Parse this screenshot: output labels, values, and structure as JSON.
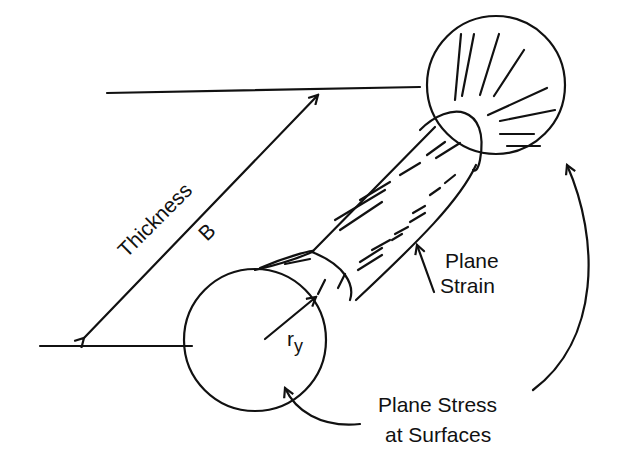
{
  "diagram": {
    "labels": {
      "thickness": "Thickness",
      "thickness_symbol": "B",
      "radius_main": "r",
      "radius_sub": "y",
      "plane_strain_line1": "Plane",
      "plane_strain_line2": "Strain",
      "plane_stress_line1": "Plane Stress",
      "plane_stress_line2": "at Surfaces"
    },
    "colors": {
      "ink": "#111111",
      "background": "#ffffff"
    }
  }
}
